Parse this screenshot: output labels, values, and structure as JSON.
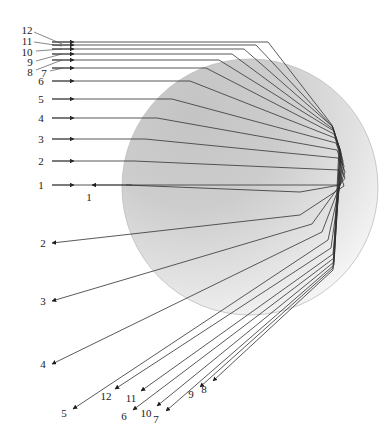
{
  "figure": {
    "type": "optics-ray-diagram",
    "canvas": {
      "width": 392,
      "height": 444
    },
    "background_color": "#ffffff",
    "ray_color": "#2b2b2b",
    "leader_color": "#4a4a4a",
    "sphere": {
      "name": "refracting-sphere",
      "cx": 250,
      "cy": 187,
      "r": 128,
      "fill_dark": "#c9c9c9",
      "fill_light": "#fbfbfb",
      "stroke": "#b5b5b5"
    },
    "incoming_rays": [
      {
        "id": "1",
        "y": 185,
        "x_start": 52,
        "arrow_x": 74
      },
      {
        "id": "2",
        "y": 161,
        "x_start": 52,
        "arrow_x": 74
      },
      {
        "id": "3",
        "y": 139,
        "x_start": 52,
        "arrow_x": 74
      },
      {
        "id": "4",
        "y": 118,
        "x_start": 52,
        "arrow_x": 74
      },
      {
        "id": "5",
        "y": 99,
        "x_start": 52,
        "arrow_x": 74
      },
      {
        "id": "6",
        "y": 81,
        "x_start": 52,
        "arrow_x": 74
      },
      {
        "id": "7",
        "y": 68,
        "x_start": 52,
        "arrow_x": 74
      },
      {
        "id": "8",
        "y": 60,
        "x_start": 52,
        "arrow_x": 74
      },
      {
        "id": "9",
        "y": 54,
        "x_start": 52,
        "arrow_x": 74
      },
      {
        "id": "10",
        "y": 49,
        "x_start": 52,
        "arrow_x": 74
      },
      {
        "id": "11",
        "y": 45,
        "x_start": 52,
        "arrow_x": 74
      },
      {
        "id": "12",
        "y": 42,
        "x_start": 52,
        "arrow_x": 74
      }
    ],
    "entry_labels": [
      {
        "text": "1",
        "x": 41,
        "y": 185,
        "leader": null
      },
      {
        "text": "2",
        "x": 41,
        "y": 161,
        "leader": null
      },
      {
        "text": "3",
        "x": 41,
        "y": 139,
        "leader": null
      },
      {
        "text": "4",
        "x": 41,
        "y": 118,
        "leader": null
      },
      {
        "text": "5",
        "x": 41,
        "y": 99,
        "leader": null
      },
      {
        "text": "6",
        "x": 41,
        "y": 81,
        "leader": null
      },
      {
        "text": "7",
        "x": 44,
        "y": 73,
        "leader": [
          50,
          71,
          63,
          68
        ]
      },
      {
        "text": "8",
        "x": 30,
        "y": 72,
        "leader": [
          36,
          70,
          62,
          60
        ]
      },
      {
        "text": "9",
        "x": 30,
        "y": 62,
        "leader": [
          36,
          61,
          62,
          54
        ]
      },
      {
        "text": "10",
        "x": 27,
        "y": 52,
        "leader": [
          36,
          51,
          62,
          49
        ]
      },
      {
        "text": "11",
        "x": 27,
        "y": 41,
        "leader": [
          34,
          42,
          62,
          46
        ]
      },
      {
        "text": "12",
        "x": 27,
        "y": 30,
        "leader": [
          34,
          32,
          62,
          44
        ]
      }
    ],
    "exit_labels": [
      {
        "text": "1",
        "x": 89,
        "y": 197
      },
      {
        "text": "2",
        "x": 43,
        "y": 243
      },
      {
        "text": "3",
        "x": 43,
        "y": 301
      },
      {
        "text": "4",
        "x": 43,
        "y": 364
      },
      {
        "text": "5",
        "x": 64,
        "y": 413
      },
      {
        "text": "6",
        "x": 124,
        "y": 416
      },
      {
        "text": "7",
        "x": 156,
        "y": 419
      },
      {
        "text": "8",
        "x": 204,
        "y": 389
      },
      {
        "text": "9",
        "x": 191,
        "y": 394
      },
      {
        "text": "10",
        "x": 146,
        "y": 413
      },
      {
        "text": "11",
        "x": 131,
        "y": 398
      },
      {
        "text": "12",
        "x": 106,
        "y": 396
      }
    ],
    "caustic": {
      "x": 336,
      "y": 165,
      "description": "convergence region near right limb"
    }
  }
}
